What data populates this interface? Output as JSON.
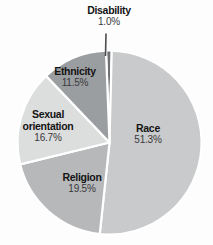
{
  "chart_data": {
    "type": "pie",
    "title": "",
    "slices": [
      {
        "label": "Disability",
        "value": 1.0,
        "display": "1.0%",
        "color": "#6f7174"
      },
      {
        "label": "Race",
        "value": 51.3,
        "display": "51.3%",
        "color": "#c9cacb"
      },
      {
        "label": "Religion",
        "value": 19.5,
        "display": "19.5%",
        "color": "#b6b8ba"
      },
      {
        "label": "Sexual orientation",
        "value": 16.7,
        "display": "16.7%",
        "color": "#dcdddd"
      },
      {
        "label": "Ethnicity",
        "value": 11.5,
        "display": "11.5%",
        "color": "#9b9ea1"
      }
    ],
    "start_angle_deg": -2.2,
    "direction": "clockwise",
    "slice_gap_color": "#ffffff",
    "legend": "none",
    "labels_position": "Disability outside with leader line; all other labels inside slices"
  }
}
